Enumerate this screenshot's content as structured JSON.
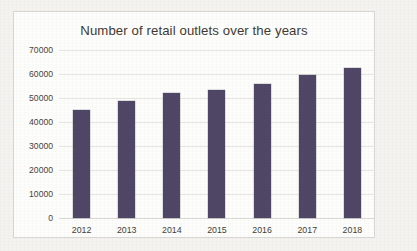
{
  "chart_data": {
    "type": "bar",
    "title": "Number of retail outlets over the years",
    "xlabel": "",
    "ylabel": "",
    "categories": [
      "2012",
      "2013",
      "2014",
      "2015",
      "2016",
      "2017",
      "2018"
    ],
    "values": [
      45000,
      48700,
      52000,
      53400,
      55900,
      59400,
      62400
    ],
    "ylim": [
      0,
      70000
    ],
    "yticks": [
      "0",
      "10000",
      "20000",
      "30000",
      "40000",
      "50000",
      "60000",
      "70000"
    ],
    "ytick_values": [
      0,
      10000,
      20000,
      30000,
      40000,
      50000,
      60000,
      70000
    ],
    "grid": true,
    "legend": false,
    "series_color": "#4f4765",
    "plot_background": "#fdfdfc",
    "gridline_color": "#e6e5e1",
    "page_background": "#f4f3ef"
  }
}
